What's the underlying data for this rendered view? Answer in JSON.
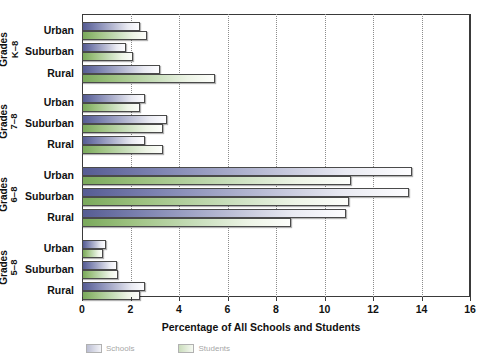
{
  "chart_data": {
    "type": "bar",
    "orientation": "horizontal",
    "title": "",
    "xlabel": "Percentage of All Schools and Students",
    "ylabel": "",
    "xlim": [
      0,
      16
    ],
    "xticks": [
      0,
      2,
      4,
      6,
      8,
      10,
      12,
      14,
      16
    ],
    "grid": "vertical-dotted",
    "legend_position": "bottom",
    "series": [
      {
        "name": "Schools",
        "color": "#565c93",
        "values": [
          2.4,
          1.8,
          3.2,
          2.6,
          3.5,
          2.6,
          13.6,
          13.5,
          10.9,
          1.0,
          1.45,
          2.6
        ]
      },
      {
        "name": "Students",
        "color": "#7aa95b",
        "values": [
          2.7,
          2.1,
          5.5,
          2.4,
          3.35,
          3.35,
          11.1,
          11.0,
          8.6,
          0.85,
          1.5,
          2.4
        ]
      }
    ],
    "groups": [
      {
        "label": "Grades",
        "sublabel": "K–8",
        "categories": [
          "Urban",
          "Suburban",
          "Rural"
        ]
      },
      {
        "label": "Grades",
        "sublabel": "7–8",
        "categories": [
          "Urban",
          "Suburban",
          "Rural"
        ]
      },
      {
        "label": "Grades",
        "sublabel": "6–8",
        "categories": [
          "Urban",
          "Suburban",
          "Rural"
        ]
      },
      {
        "label": "Grades",
        "sublabel": "5–8",
        "categories": [
          "Urban",
          "Suburban",
          "Rural"
        ]
      }
    ],
    "categories": [
      "Grades K–8 Urban",
      "Grades K–8 Suburban",
      "Grades K–8 Rural",
      "Grades 7–8 Urban",
      "Grades 7–8 Suburban",
      "Grades 7–8 Rural",
      "Grades 6–8 Urban",
      "Grades 6–8 Suburban",
      "Grades 6–8 Rural",
      "Grades 5–8 Urban",
      "Grades 5–8 Suburban",
      "Grades 5–8 Rural"
    ]
  },
  "axis": {
    "tick_labels": [
      "0",
      "2",
      "4",
      "6",
      "8",
      "10",
      "12",
      "14",
      "16"
    ],
    "title": "Percentage of All Schools and Students"
  },
  "labels": {
    "grades_word": "Grades",
    "groups": [
      "K–8",
      "7–8",
      "6–8",
      "5–8"
    ],
    "categories": [
      "Urban",
      "Suburban",
      "Rural"
    ]
  },
  "legend": {
    "items": [
      {
        "label": "Schools",
        "color": "#565c93"
      },
      {
        "label": "Students",
        "color": "#7aa95b"
      }
    ]
  }
}
